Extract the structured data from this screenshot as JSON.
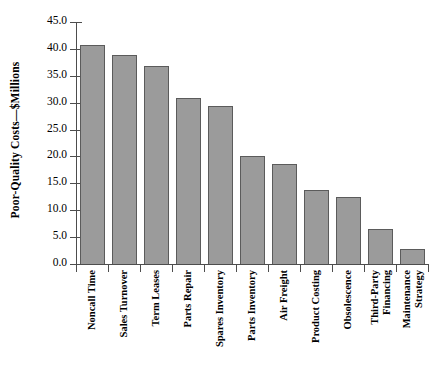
{
  "chart_data": {
    "type": "bar",
    "title": "",
    "xlabel": "",
    "ylabel": "Poor-Quality Costs—$Millions",
    "ylim": [
      0.0,
      45.0
    ],
    "ytick_labels": [
      "45.0",
      "40.0",
      "35.0",
      "30.0",
      "25.0",
      "20.0",
      "15.0",
      "10.0",
      "5.0",
      "0.0"
    ],
    "ytick_values": [
      45.0,
      40.0,
      35.0,
      30.0,
      25.0,
      20.0,
      15.0,
      10.0,
      5.0,
      0.0
    ],
    "grid": false,
    "legend": null,
    "bar_color": "#9b9b9b",
    "bar_border_color": "#5b5b5b",
    "axis_color": "#4d4d4d",
    "categories": [
      "Noncall Time",
      "Sales Turnover",
      "Term Leases",
      "Parts Repair",
      "Spares Inventory",
      "Parts Inventory",
      "Air Freight",
      "Product Costing",
      "Obsolescence",
      "Third-Party Financing",
      "Maintenance Strategy"
    ],
    "category_lines": [
      [
        "Noncall Time"
      ],
      [
        "Sales Turnover"
      ],
      [
        "Term Leases"
      ],
      [
        "Parts Repair"
      ],
      [
        "Spares Inventory"
      ],
      [
        "Parts Inventory"
      ],
      [
        "Air Freight"
      ],
      [
        "Product Costing"
      ],
      [
        "Obsolescence"
      ],
      [
        "Third-Party",
        "Financing"
      ],
      [
        "Maintenance",
        "Strategy"
      ]
    ],
    "values": [
      40.7,
      38.8,
      36.8,
      30.9,
      29.4,
      20.0,
      18.6,
      13.7,
      12.5,
      6.6,
      2.8
    ]
  }
}
